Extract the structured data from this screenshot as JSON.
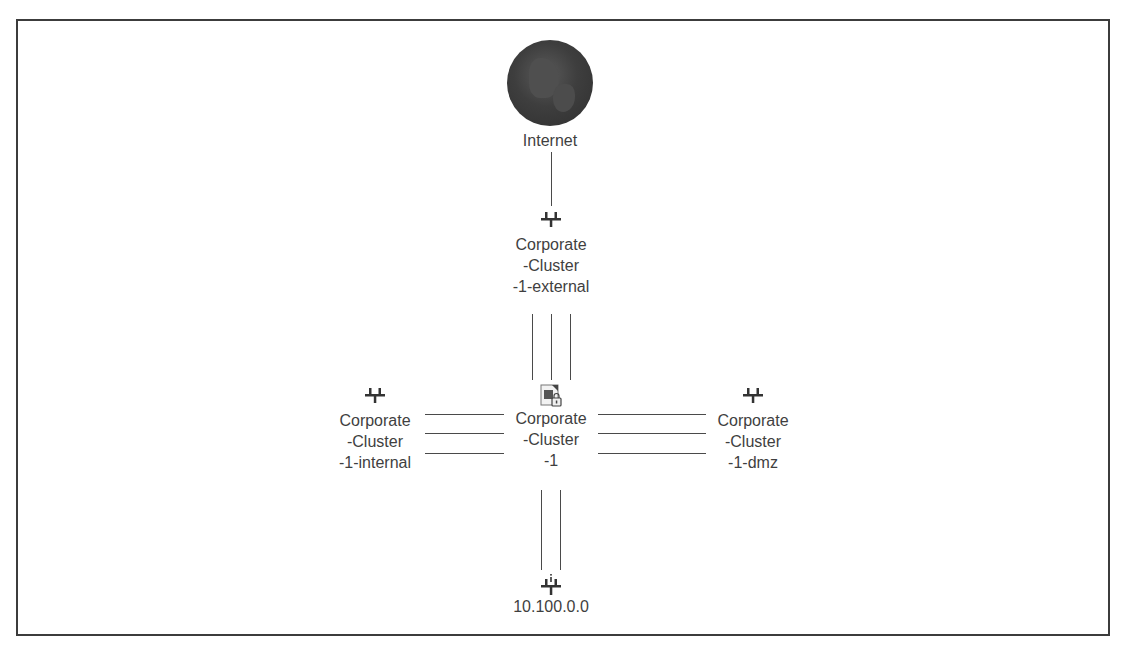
{
  "diagram": {
    "type": "network-topology",
    "nodes": {
      "internet": {
        "label": "Internet",
        "icon": "globe-icon"
      },
      "external": {
        "label": "Corporate\n-Cluster\n-1-external",
        "icon": "network-icon"
      },
      "internal": {
        "label": "Corporate\n-Cluster\n-1-internal",
        "icon": "network-icon"
      },
      "cluster": {
        "label": "Corporate\n-Cluster\n-1",
        "icon": "firewall-cluster-icon"
      },
      "dmz": {
        "label": "Corporate\n-Cluster\n-1-dmz",
        "icon": "network-icon"
      },
      "subnet": {
        "label": "10.100.0.0",
        "icon": "network-info-icon"
      }
    },
    "edges": [
      {
        "from": "internet",
        "to": "external",
        "count": 1
      },
      {
        "from": "external",
        "to": "cluster",
        "count": 3
      },
      {
        "from": "internal",
        "to": "cluster",
        "count": 3
      },
      {
        "from": "cluster",
        "to": "dmz",
        "count": 3
      },
      {
        "from": "cluster",
        "to": "subnet",
        "count": 2
      }
    ],
    "colors": {
      "line": "#4a4a4a",
      "text": "#3f3f3f",
      "frame": "#3c3c3c"
    }
  }
}
